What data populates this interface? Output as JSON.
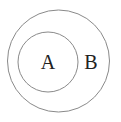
{
  "diagram": {
    "type": "euler",
    "sets": [
      {
        "name": "A",
        "label": "A",
        "relation": "subset of B"
      },
      {
        "name": "B",
        "label": "B"
      }
    ],
    "colors": {
      "stroke": "#888888",
      "text": "#222222",
      "background": "#ffffff"
    }
  }
}
